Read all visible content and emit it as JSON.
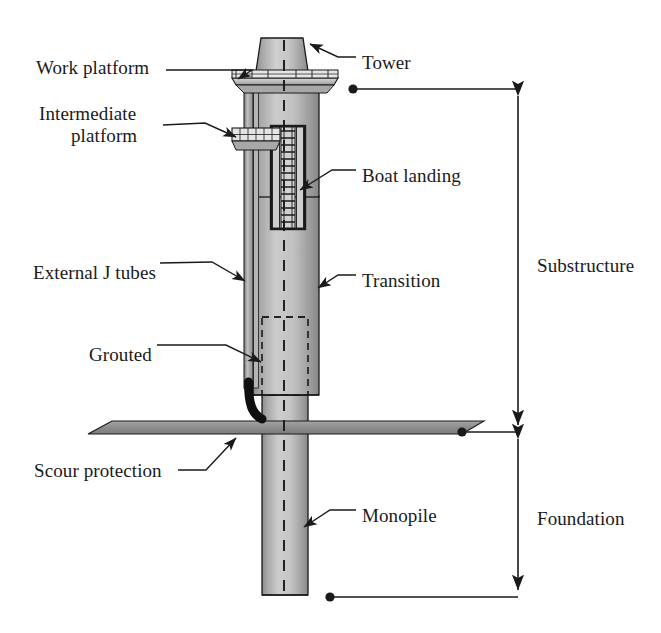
{
  "figure": {
    "type": "technical-cutaway-diagram",
    "width": 661,
    "height": 633,
    "background_color": "#ffffff",
    "line_color": "#1a1a1a",
    "steel_fill_light": "#c9c9c9",
    "steel_fill_mid": "#b3b3b3",
    "steel_fill_dark": "#8c8c8c",
    "scour_fill": "#8f8f8f",
    "jtube_fill": "#101010"
  },
  "callouts": [
    {
      "id": "work-platform",
      "label": "Work platform",
      "side": "left",
      "x": 36,
      "y": 57,
      "lines": 1
    },
    {
      "id": "intermediate-platform",
      "label": "Intermediate",
      "label2": "platform",
      "side": "left",
      "x": 39,
      "y": 103,
      "lines": 2
    },
    {
      "id": "external-j-tubes",
      "label": "External J tubes",
      "side": "left",
      "x": 33,
      "y": 262,
      "lines": 1
    },
    {
      "id": "grouted",
      "label": "Grouted",
      "side": "left",
      "x": 89,
      "y": 344,
      "lines": 1
    },
    {
      "id": "scour-protection",
      "label": "Scour protection",
      "side": "left",
      "x": 34,
      "y": 460,
      "lines": 1
    },
    {
      "id": "tower",
      "label": "Tower",
      "side": "right",
      "x": 362,
      "y": 52,
      "lines": 1
    },
    {
      "id": "boat-landing",
      "label": "Boat landing",
      "side": "right",
      "x": 362,
      "y": 165,
      "lines": 1
    },
    {
      "id": "transition",
      "label": "Transition",
      "side": "right",
      "x": 362,
      "y": 270,
      "lines": 1
    },
    {
      "id": "monopile",
      "label": "Monopile",
      "side": "right",
      "x": 362,
      "y": 505,
      "lines": 1
    }
  ],
  "dimensions": [
    {
      "id": "substructure",
      "label": "Substructure",
      "label_x": 537,
      "label_y": 255,
      "axis_x": 518,
      "top_y": 89,
      "bottom_y": 432,
      "extension_top_dot_x": 353,
      "extension_bottom_dot_x": 462
    },
    {
      "id": "foundation",
      "label": "Foundation",
      "label_x": 537,
      "label_y": 508,
      "axis_x": 518,
      "top_y": 432,
      "bottom_y": 597,
      "extension_bottom_dot_x": 330
    }
  ],
  "components": {
    "tower": {
      "name": "Tower",
      "shape": "tapered-cylinder"
    },
    "work_platform": {
      "name": "Work platform",
      "shape": "railed-deck"
    },
    "intermediate_platform": {
      "name": "Intermediate platform",
      "shape": "railed-deck"
    },
    "boat_landing": {
      "name": "Boat landing",
      "shape": "ladder-frame"
    },
    "transition_piece": {
      "name": "Transition",
      "shape": "cylinder"
    },
    "external_j_tubes": {
      "name": "External J tubes",
      "shape": "vertical-tubes-with-curved-foot"
    },
    "grouted_connection": {
      "name": "Grouted",
      "shape": "dashed-overlap-region"
    },
    "scour_protection": {
      "name": "Scour protection",
      "shape": "flat-slab"
    },
    "monopile": {
      "name": "Monopile",
      "shape": "cylinder"
    },
    "centreline": {
      "name": "Centreline",
      "shape": "dashed-vertical-line"
    }
  }
}
